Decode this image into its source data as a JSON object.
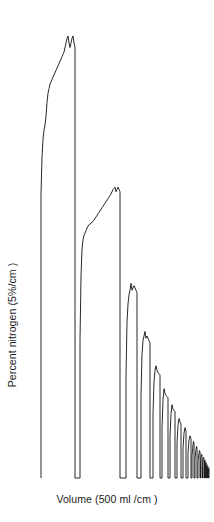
{
  "chart_data": {
    "type": "line",
    "title": "",
    "subtitle": "",
    "xlabel": "Volume (500 ml /cm )",
    "ylabel": "Percent nitrogen (5%/cm )",
    "grid": false,
    "legend": null,
    "axes_visible": false,
    "xunit_per_cm": 500,
    "xunit_name": "ml",
    "yunit_per_cm": 5,
    "yunit_name": "%",
    "xlim": [
      0,
      214
    ],
    "ylim": [
      0,
      100
    ],
    "baseline_y_percent": 0,
    "peaks": [
      {
        "index": 1,
        "x_start": 41,
        "x_end": 75,
        "peak_percent": 96.5,
        "plateau_percent": 92.0
      },
      {
        "index": 2,
        "x_start": 80,
        "x_end": 120,
        "peak_percent": 63.5,
        "plateau_percent": 59.0
      },
      {
        "index": 3,
        "x_start": 126,
        "x_end": 137,
        "peak_percent": 42.5,
        "plateau_percent": 40.0
      },
      {
        "index": 4,
        "x_start": 141,
        "x_end": 150,
        "peak_percent": 32.0,
        "plateau_percent": 30.0
      },
      {
        "index": 5,
        "x_start": 153,
        "x_end": 160,
        "peak_percent": 24.5,
        "plateau_percent": 23.0
      },
      {
        "index": 6,
        "x_start": 162,
        "x_end": 168,
        "peak_percent": 19.5,
        "plateau_percent": 18.0
      },
      {
        "index": 7,
        "x_start": 170,
        "x_end": 175,
        "peak_percent": 16.0,
        "plateau_percent": 15.0
      },
      {
        "index": 8,
        "x_start": 177,
        "x_end": 181,
        "peak_percent": 13.0,
        "plateau_percent": 12.0
      },
      {
        "index": 9,
        "x_start": 183,
        "x_end": 186,
        "peak_percent": 11.0,
        "plateau_percent": 10.2
      },
      {
        "index": 10,
        "x_start": 188,
        "x_end": 191,
        "peak_percent": 9.2,
        "plateau_percent": 8.6
      },
      {
        "index": 11,
        "x_start": 192,
        "x_end": 194,
        "peak_percent": 8.0,
        "plateau_percent": 7.5
      },
      {
        "index": 12,
        "x_start": 195,
        "x_end": 197,
        "peak_percent": 6.9,
        "plateau_percent": 6.5
      },
      {
        "index": 13,
        "x_start": 198,
        "x_end": 200,
        "peak_percent": 6.0,
        "plateau_percent": 5.7
      },
      {
        "index": 14,
        "x_start": 200,
        "x_end": 202,
        "peak_percent": 5.2,
        "plateau_percent": 5.0
      },
      {
        "index": 15,
        "x_start": 202,
        "x_end": 204,
        "peak_percent": 4.5,
        "plateau_percent": 4.3
      },
      {
        "index": 16,
        "x_start": 204,
        "x_end": 205,
        "peak_percent": 3.9,
        "plateau_percent": 3.7
      },
      {
        "index": 17,
        "x_start": 205,
        "x_end": 206,
        "peak_percent": 3.4,
        "plateau_percent": 3.2
      },
      {
        "index": 18,
        "x_start": 206,
        "x_end": 207,
        "peak_percent": 2.9,
        "plateau_percent": 2.8
      },
      {
        "index": 19,
        "x_start": 207,
        "x_end": 208,
        "peak_percent": 2.5,
        "plateau_percent": 2.4
      },
      {
        "index": 20,
        "x_start": 208,
        "x_end": 209,
        "peak_percent": 2.1,
        "plateau_percent": 2.0
      }
    ],
    "series": [
      {
        "name": "percent nitrogen",
        "points": [
          [
            41,
            0
          ],
          [
            41,
            62
          ],
          [
            42,
            70
          ],
          [
            43,
            74
          ],
          [
            44,
            76
          ],
          [
            45,
            77
          ],
          [
            46,
            79
          ],
          [
            47,
            82
          ],
          [
            48,
            84
          ],
          [
            49,
            85
          ],
          [
            50,
            86
          ],
          [
            52,
            87
          ],
          [
            54,
            88
          ],
          [
            56,
            89
          ],
          [
            58,
            90
          ],
          [
            60,
            91
          ],
          [
            62,
            92
          ],
          [
            64,
            93
          ],
          [
            66,
            95
          ],
          [
            67,
            96
          ],
          [
            68,
            96.5
          ],
          [
            69,
            95
          ],
          [
            70,
            94
          ],
          [
            71,
            95
          ],
          [
            72,
            96
          ],
          [
            73,
            96.5
          ],
          [
            74,
            95
          ],
          [
            75,
            94
          ],
          [
            75,
            0
          ],
          [
            80,
            0
          ],
          [
            80,
            30
          ],
          [
            81,
            44
          ],
          [
            82,
            50
          ],
          [
            83,
            52
          ],
          [
            84,
            53
          ],
          [
            86,
            54
          ],
          [
            88,
            55
          ],
          [
            90,
            55.5
          ],
          [
            93,
            56
          ],
          [
            96,
            57
          ],
          [
            99,
            58
          ],
          [
            102,
            59
          ],
          [
            105,
            60
          ],
          [
            108,
            61
          ],
          [
            111,
            62
          ],
          [
            113,
            63
          ],
          [
            115,
            63.5
          ],
          [
            116,
            62.5
          ],
          [
            117,
            63
          ],
          [
            118,
            63.5
          ],
          [
            119,
            63
          ],
          [
            120,
            62.5
          ],
          [
            120,
            0
          ],
          [
            126,
            0
          ],
          [
            126,
            22
          ],
          [
            127,
            34
          ],
          [
            128,
            38
          ],
          [
            129,
            40
          ],
          [
            130,
            41
          ],
          [
            131,
            42.5
          ],
          [
            132,
            41
          ],
          [
            133,
            41.5
          ],
          [
            134,
            42
          ],
          [
            135,
            41.5
          ],
          [
            136,
            41
          ],
          [
            137,
            40.5
          ],
          [
            137,
            0
          ],
          [
            141,
            0
          ],
          [
            141,
            18
          ],
          [
            142,
            27
          ],
          [
            143,
            30
          ],
          [
            144,
            31
          ],
          [
            145,
            32
          ],
          [
            146,
            30.5
          ],
          [
            147,
            31
          ],
          [
            148,
            30.5
          ],
          [
            149,
            30
          ],
          [
            150,
            29.5
          ],
          [
            150,
            0
          ],
          [
            153,
            0
          ],
          [
            153,
            14
          ],
          [
            154,
            21
          ],
          [
            155,
            23.5
          ],
          [
            156,
            24.5
          ],
          [
            157,
            23.5
          ],
          [
            158,
            23
          ],
          [
            159,
            22.8
          ],
          [
            160,
            22.5
          ],
          [
            160,
            0
          ],
          [
            162,
            0
          ],
          [
            162,
            11
          ],
          [
            163,
            17
          ],
          [
            164,
            19.5
          ],
          [
            165,
            18.5
          ],
          [
            166,
            18
          ],
          [
            167,
            17.8
          ],
          [
            168,
            17.5
          ],
          [
            168,
            0
          ],
          [
            170,
            0
          ],
          [
            170,
            9
          ],
          [
            171,
            14
          ],
          [
            172,
            16
          ],
          [
            173,
            15
          ],
          [
            174,
            14.8
          ],
          [
            175,
            14.5
          ],
          [
            175,
            0
          ],
          [
            177,
            0
          ],
          [
            177,
            7.5
          ],
          [
            178,
            11.5
          ],
          [
            179,
            13
          ],
          [
            180,
            12.2
          ],
          [
            181,
            11.8
          ],
          [
            181,
            0
          ],
          [
            183,
            0
          ],
          [
            183,
            6.5
          ],
          [
            184,
            9.8
          ],
          [
            185,
            11
          ],
          [
            186,
            10.2
          ],
          [
            186,
            0
          ],
          [
            188,
            0
          ],
          [
            188,
            5.5
          ],
          [
            189,
            8.3
          ],
          [
            190,
            9.2
          ],
          [
            191,
            8.6
          ],
          [
            191,
            0
          ],
          [
            192,
            0
          ],
          [
            192,
            4.8
          ],
          [
            193,
            7.2
          ],
          [
            193.5,
            8.0
          ],
          [
            194,
            7.5
          ],
          [
            194,
            0
          ],
          [
            195,
            0
          ],
          [
            195,
            4.2
          ],
          [
            196,
            6.3
          ],
          [
            196.5,
            6.9
          ],
          [
            197,
            6.5
          ],
          [
            197,
            0
          ],
          [
            198,
            0
          ],
          [
            198,
            3.7
          ],
          [
            199,
            5.5
          ],
          [
            199.5,
            6.0
          ],
          [
            200,
            5.7
          ],
          [
            200,
            0
          ],
          [
            200.5,
            0
          ],
          [
            200.5,
            3.2
          ],
          [
            201,
            4.8
          ],
          [
            201.5,
            5.2
          ],
          [
            202,
            5.0
          ],
          [
            202,
            0
          ],
          [
            202.5,
            0
          ],
          [
            202.5,
            2.8
          ],
          [
            203,
            4.2
          ],
          [
            203.5,
            4.5
          ],
          [
            204,
            4.3
          ],
          [
            204,
            0
          ],
          [
            204.3,
            0
          ],
          [
            204.3,
            2.5
          ],
          [
            204.7,
            3.6
          ],
          [
            205,
            3.9
          ],
          [
            205,
            0
          ],
          [
            205.3,
            0
          ],
          [
            205.3,
            2.1
          ],
          [
            205.7,
            3.1
          ],
          [
            206,
            3.4
          ],
          [
            206,
            0
          ],
          [
            206.3,
            0
          ],
          [
            206.3,
            1.8
          ],
          [
            206.7,
            2.7
          ],
          [
            207,
            2.9
          ],
          [
            207,
            0
          ],
          [
            207.3,
            0
          ],
          [
            207.3,
            1.5
          ],
          [
            207.7,
            2.3
          ],
          [
            208,
            2.5
          ],
          [
            208,
            0
          ],
          [
            208.3,
            0
          ],
          [
            208.3,
            1.3
          ],
          [
            208.7,
            1.9
          ],
          [
            209,
            2.1
          ],
          [
            209,
            0
          ]
        ]
      }
    ]
  },
  "figure": {
    "background_color": "#ffffff",
    "trace_color": "#111111",
    "text_color": "#1a1a1a"
  }
}
